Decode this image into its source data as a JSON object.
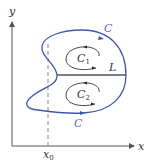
{
  "diagram": {
    "axes": {
      "x_label": "x",
      "y_label": "y",
      "x0_label": "x",
      "x0_subscript": "0"
    },
    "labels": {
      "curve_top": "C",
      "curve_bottom": "C",
      "c1_main": "C",
      "c1_sub": "1",
      "c2_main": "C",
      "c2_sub": "2",
      "line": "L"
    },
    "colors": {
      "curve": "#3f56b0",
      "axis": "#555555",
      "line_L": "#555555",
      "dashed": "#777777",
      "label_blue": "#5a6cc0",
      "label_dark": "#333333"
    }
  }
}
